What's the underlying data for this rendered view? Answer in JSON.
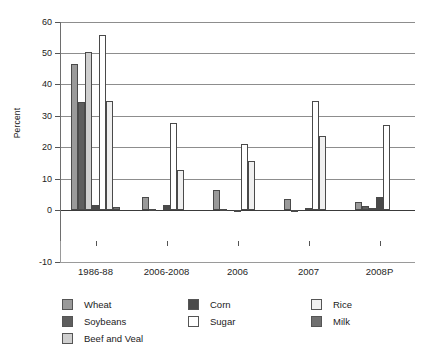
{
  "chart_data": {
    "type": "bar",
    "title": "",
    "subtitle": "",
    "xlabel": "",
    "ylabel": "Percent",
    "ylim": [
      -10,
      60
    ],
    "yticks": [
      60,
      50,
      40,
      30,
      20,
      10,
      0,
      -10
    ],
    "grid": true,
    "legend_position": "bottom",
    "categories": [
      "1986-88",
      "2006-2008",
      "2006",
      "2007",
      "2008P"
    ],
    "series": [
      {
        "name": "Wheat",
        "color": "#9a9a9a",
        "values": [
          46.5,
          4.2,
          6.5,
          3.5,
          2.6
        ]
      },
      {
        "name": "Soybeans",
        "color": "#5e5e5e",
        "values": [
          34.6,
          0.3,
          0.4,
          -0.6,
          1.4
        ]
      },
      {
        "name": "Beef and Veal",
        "color": "#cfcfcf",
        "values": [
          50.4,
          -0.2,
          0.1,
          0.2,
          0.5
        ]
      },
      {
        "name": "Corn",
        "color": "#4a4a4a",
        "values": [
          1.5,
          1.5,
          -0.6,
          0.5,
          4.2
        ]
      },
      {
        "name": "Sugar",
        "color": "#ffffff",
        "values": [
          56.0,
          27.7,
          21.2,
          34.8,
          27.0
        ]
      },
      {
        "name": "Rice",
        "color": "#f0f0f0",
        "values": [
          34.9,
          12.9,
          15.5,
          23.5,
          0.0
        ]
      },
      {
        "name": "Milk",
        "color": "#707070",
        "values": [
          0.9,
          0.1,
          0.1,
          0.1,
          0.0
        ]
      }
    ]
  },
  "legend": {
    "items": [
      {
        "label": "Wheat"
      },
      {
        "label": "Soybeans"
      },
      {
        "label": "Beef and Veal"
      },
      {
        "label": "Corn"
      },
      {
        "label": "Sugar"
      },
      {
        "label": "Rice"
      },
      {
        "label": "Milk"
      }
    ]
  },
  "axis": {
    "y_title": "Percent",
    "y_ticks": [
      "60",
      "50",
      "40",
      "30",
      "20",
      "10",
      "0",
      "-10"
    ],
    "x_ticks": [
      "1986-88",
      "2006-2008",
      "2006",
      "2007",
      "2008P"
    ]
  }
}
